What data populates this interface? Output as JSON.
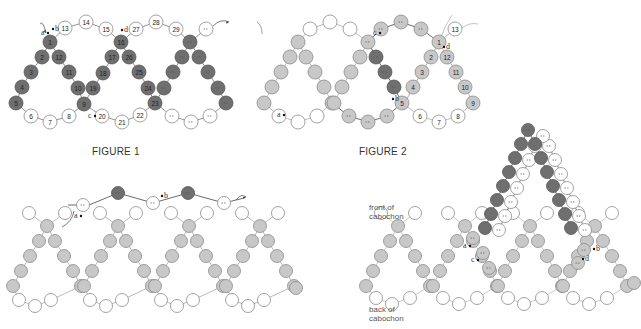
{
  "figures": [
    {
      "id": "fig1",
      "caption": "FIGURE 1"
    },
    {
      "id": "fig2",
      "caption": "FIGURE 2"
    },
    {
      "id": "fig3",
      "caption": ""
    },
    {
      "id": "fig4",
      "caption": "",
      "labels": {
        "front": "front of cabochon",
        "back": "back of cabochon"
      }
    }
  ],
  "colors": {
    "dark_bead": "#6f6f6f",
    "medium_bead": "#c8c8c8",
    "light_bead": "#ffffff",
    "thread": "#444444",
    "outline": "#8a8a8a"
  },
  "fig1": {
    "point_labels": [
      "a",
      "b",
      "c",
      "d"
    ],
    "bead_numbers": [
      "1",
      "2",
      "3",
      "4",
      "5",
      "6",
      "7",
      "8",
      "9",
      "10",
      "11",
      "12",
      "13",
      "14",
      "15",
      "16",
      "17",
      "18",
      "19",
      "20",
      "21",
      "22",
      "23",
      "24",
      "25",
      "26",
      "27",
      "28",
      "29"
    ]
  },
  "fig2": {
    "point_labels": [
      "a",
      "b",
      "c",
      "d"
    ],
    "bead_numbers": [
      "1",
      "2",
      "3",
      "4",
      "5",
      "6",
      "7",
      "8",
      "9",
      "10",
      "11",
      "12",
      "13"
    ]
  },
  "fig3": {
    "point_labels": [
      "a",
      "b"
    ]
  },
  "fig4": {
    "point_labels": [
      "a",
      "b",
      "c",
      "d"
    ]
  }
}
